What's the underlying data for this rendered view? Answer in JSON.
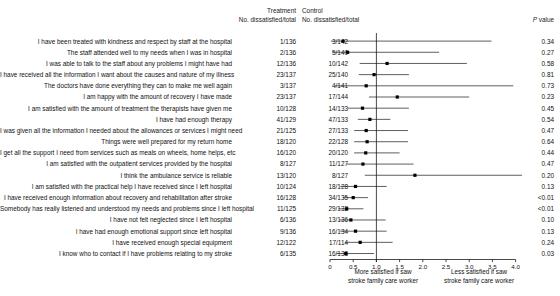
{
  "header": {
    "treatment": "Treatment",
    "treatment_sub": "No. dissatisfied/total",
    "control": "Control",
    "control_sub": "No. dissatisfied/total",
    "pvalue_italic": "P",
    "pvalue_rest": " value"
  },
  "axis": {
    "ticks": [
      "0",
      "0.5",
      "1.0",
      "1.5",
      "2.0",
      "2.5",
      "3.0",
      "3.5",
      "4.0"
    ],
    "tick_values": [
      0,
      0.5,
      1.0,
      1.5,
      2.0,
      2.5,
      3.0,
      3.5,
      4.0
    ],
    "xmin": 0,
    "xmax": 4.2,
    "null_value": 1.0,
    "caption_left": "More satisfied if saw stroke family care worker",
    "caption_left_line1": "More satisfied if saw",
    "caption_left_line2": "stroke family care worker",
    "caption_right_line1": "Less satisfied if saw",
    "caption_right_line2": "stroke family care worker"
  },
  "chart_data": {
    "type": "forest",
    "title": "",
    "xlabel": "Odds ratio",
    "ylabel": "",
    "xlim": [
      0,
      4.2
    ],
    "null_line": 1.0,
    "grid": false,
    "columns": [
      "Question",
      "Treatment No. dissatisfied/total",
      "Control No. dissatisfied/total",
      "Odds ratio (95% CI)",
      "P value"
    ],
    "rows": [
      {
        "label": "I have been treated with kindness and respect by staff at the hospital",
        "treatment": "1/136",
        "control": "3/142",
        "or": 0.28,
        "ci_low": 0.02,
        "ci_high": 3.48,
        "p": "0.34"
      },
      {
        "label": "The staff attended well to my needs when I was in hospital",
        "treatment": "2/136",
        "control": "5/140",
        "or": 0.38,
        "ci_low": 0.05,
        "ci_high": 2.35,
        "p": "0.27"
      },
      {
        "label": "I was able to talk to the staff about any problems I might have had",
        "treatment": "12/136",
        "control": "10/142",
        "or": 1.23,
        "ci_low": 0.64,
        "ci_high": 2.95,
        "p": "0.58"
      },
      {
        "label": "I have received all the information I want about the causes and nature of my illness",
        "treatment": "23/137",
        "control": "25/140",
        "or": 0.95,
        "ci_low": 0.62,
        "ci_high": 1.7,
        "p": "0.81"
      },
      {
        "label": "The doctors have done everything they can to make me well again",
        "treatment": "3/137",
        "control": "4/141",
        "or": 0.78,
        "ci_low": 0.1,
        "ci_high": 3.95,
        "p": "0.73"
      },
      {
        "label": "I am happy with the amount of recovery I have made",
        "treatment": "23/137",
        "control": "17/144",
        "or": 1.45,
        "ci_low": 0.84,
        "ci_high": 3.0,
        "p": "0.23"
      },
      {
        "label": "I am satisfied with the amount of treatment the therapists have given me",
        "treatment": "10/128",
        "control": "14/133",
        "or": 0.7,
        "ci_low": 0.38,
        "ci_high": 1.7,
        "p": "0.45"
      },
      {
        "label": "I have had enough therapy",
        "treatment": "41/129",
        "control": "47/133",
        "or": 0.86,
        "ci_low": 0.6,
        "ci_high": 1.3,
        "p": "0.54"
      },
      {
        "label": "I was given all the information I needed about the allowances or services I might need",
        "treatment": "21/125",
        "control": "27/133",
        "or": 0.78,
        "ci_low": 0.52,
        "ci_high": 1.68,
        "p": "0.47"
      },
      {
        "label": "Things were well prepared for my return home",
        "treatment": "18/120",
        "control": "22/128",
        "or": 0.8,
        "ci_low": 0.52,
        "ci_high": 1.68,
        "p": "0.64"
      },
      {
        "label": "I get all the support I need from services such as meals on wheels, home helps, etc",
        "treatment": "16/120",
        "control": "20/120",
        "or": 0.77,
        "ci_low": 0.52,
        "ci_high": 1.5,
        "p": "0.44"
      },
      {
        "label": "I am satisfied with the outpatient services provided by the hospital",
        "treatment": "8/127",
        "control": "11/127",
        "or": 0.71,
        "ci_low": 0.36,
        "ci_high": 1.8,
        "p": "0.47"
      },
      {
        "label": "I think the ambulance service is reliable",
        "treatment": "13/120",
        "control": "8/127",
        "or": 1.83,
        "ci_low": 0.75,
        "ci_high": 4.2,
        "p": "0.20"
      },
      {
        "label": "I am satisfied with the practical help I have received since I left hospital",
        "treatment": "10/124",
        "control": "18/128",
        "or": 0.55,
        "ci_low": 0.22,
        "ci_high": 1.22,
        "p": "0.13"
      },
      {
        "label": "I have received enough information about recovery and rehabilitation after stroke",
        "treatment": "16/128",
        "control": "34/135",
        "or": 0.5,
        "ci_low": 0.28,
        "ci_high": 0.82,
        "p": "<0.01"
      },
      {
        "label": "Somebody has really listened and understood my needs and problems since I left hospital",
        "treatment": "11/125",
        "control": "29/132",
        "or": 0.36,
        "ci_low": 0.18,
        "ci_high": 0.72,
        "p": "<0.01"
      },
      {
        "label": "I have not felt neglected since I left hospital",
        "treatment": "6/136",
        "control": "13/136",
        "or": 0.45,
        "ci_low": 0.2,
        "ci_high": 1.2,
        "p": "0.10"
      },
      {
        "label": "I have had enough emotional support since left hospital",
        "treatment": "9/136",
        "control": "16/134",
        "or": 0.55,
        "ci_low": 0.22,
        "ci_high": 1.22,
        "p": "0.13"
      },
      {
        "label": "I have received enough special equipment",
        "treatment": "12/122",
        "control": "17/114",
        "or": 0.65,
        "ci_low": 0.32,
        "ci_high": 1.35,
        "p": "0.24"
      },
      {
        "label": "I know who to contact if I have problems relating to my stroke",
        "treatment": "6/135",
        "control": "16/138",
        "or": 0.34,
        "ci_low": 0.14,
        "ci_high": 0.95,
        "p": "0.03"
      }
    ]
  }
}
